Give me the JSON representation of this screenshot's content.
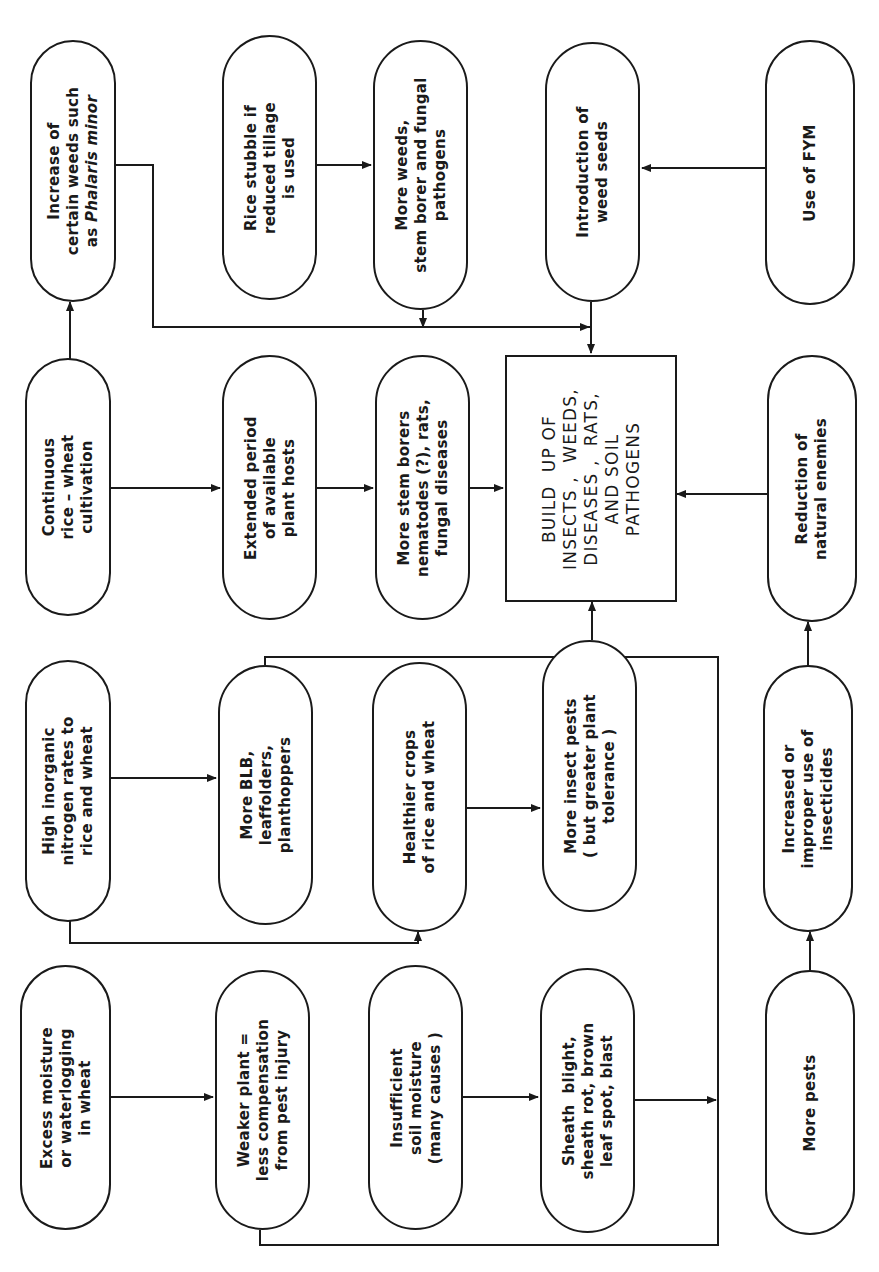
{
  "diagram": {
    "orientation": "rotated 90 degrees counter-clockwise",
    "colors": {
      "line": "#1a1a1a",
      "background": "#ffffff"
    },
    "center": {
      "id": "buildup",
      "text": "BUILD  UP OF\nINSECTS ,  WEEDS,\nDISEASES ,  RATS,\nAND SOIL\nPATHOGENS"
    },
    "nodes": {
      "increase_weeds": {
        "text": "Increase of\ncertain weeds such\nas Phalaris minor",
        "italic_part": "Phalaris minor"
      },
      "continuous": {
        "text": "Continuous\nrice – wheat\ncultivation"
      },
      "high_n": {
        "text": "High inorganic\nnitrogen rates to\nrice and wheat"
      },
      "excess_moisture": {
        "text": "Excess moisture\nor waterlogging\nin wheat"
      },
      "rice_stubble": {
        "text": "Rice stubble if\nreduced tillage\nis used"
      },
      "extended_period": {
        "text": "Extended period\nof available\nplant hosts"
      },
      "more_blb": {
        "text": "More BLB,\nleaffolders,\nplanthoppers"
      },
      "weaker_plant": {
        "text": "Weaker plant =\nless compensation\nfrom pest injury"
      },
      "more_weeds": {
        "text": "More weeds,\nstem borer and fungal\npathogens"
      },
      "more_stem_borers": {
        "text": "More stem borers\nnematodes (?), rats,\nfungal diseases"
      },
      "healthier_crops": {
        "text": "Healthier crops\nof rice and wheat"
      },
      "insufficient_moisture": {
        "text": "Insufficient\nsoil moisture\n(many causes )"
      },
      "introduction_weed_seeds": {
        "text": "Introduction of\nweed seeds"
      },
      "more_insect_pests": {
        "text": "More insect pests\n( but greater plant\ntolerance )"
      },
      "sheath_blight": {
        "text": "Sheath  blight,\nsheath rot, brown\nleaf spot, blast"
      },
      "use_fym": {
        "text": "Use of FYM"
      },
      "reduction_enemies": {
        "text": "Reduction of\nnatural enemies"
      },
      "increased_insecticides": {
        "text": "Increased or\nimproper use of\ninsecticides"
      },
      "more_pests": {
        "text": "More pests"
      }
    },
    "edges": [
      {
        "from": "continuous",
        "to": "increase_weeds"
      },
      {
        "from": "continuous",
        "to": "extended_period"
      },
      {
        "from": "extended_period",
        "to": "more_stem_borers"
      },
      {
        "from": "more_stem_borers",
        "to": "buildup"
      },
      {
        "from": "increase_weeds",
        "to": "buildup"
      },
      {
        "from": "rice_stubble",
        "to": "more_weeds"
      },
      {
        "from": "more_weeds",
        "to": "buildup"
      },
      {
        "from": "introduction_weed_seeds",
        "to": "buildup"
      },
      {
        "from": "use_fym",
        "to": "introduction_weed_seeds"
      },
      {
        "from": "high_n",
        "to": "more_blb"
      },
      {
        "from": "high_n",
        "to": "healthier_crops"
      },
      {
        "from": "healthier_crops",
        "to": "more_insect_pests"
      },
      {
        "from": "more_blb",
        "to": "buildup"
      },
      {
        "from": "more_insect_pests",
        "to": "buildup"
      },
      {
        "from": "excess_moisture",
        "to": "weaker_plant"
      },
      {
        "from": "weaker_plant",
        "to": "buildup"
      },
      {
        "from": "insufficient_moisture",
        "to": "sheath_blight"
      },
      {
        "from": "sheath_blight",
        "to": "buildup"
      },
      {
        "from": "more_pests",
        "to": "increased_insecticides"
      },
      {
        "from": "increased_insecticides",
        "to": "reduction_enemies"
      },
      {
        "from": "reduction_enemies",
        "to": "buildup"
      }
    ]
  }
}
